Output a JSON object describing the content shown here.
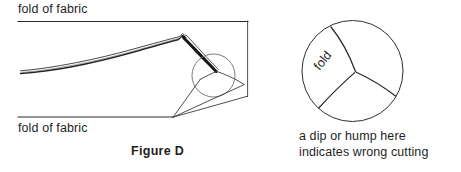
{
  "figure": {
    "title": "Figure D",
    "labels": {
      "fold_top": "fold of fabric",
      "fold_bottom": "fold of fabric",
      "fold_inset": "fold"
    },
    "detail_caption": {
      "line1": "a dip or hump here",
      "line2": "indicates wrong cutting"
    },
    "colors": {
      "background": "#ffffff",
      "ink": "#1f1f1f",
      "line": "#2b2b2b",
      "thin_line": "#3a3a3a"
    },
    "icons": {
      "magnifier": "magnifier-circle-icon",
      "detail_circle": "detail-circle-icon"
    }
  }
}
